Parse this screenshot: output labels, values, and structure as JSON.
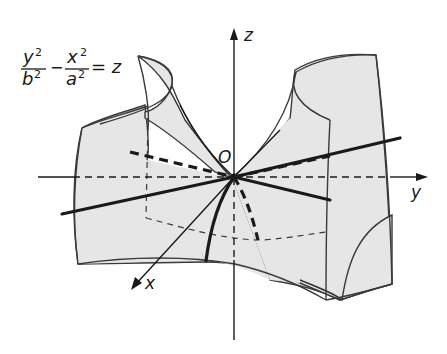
{
  "figure": {
    "equation": {
      "y_num": "y",
      "y_den": "b",
      "x_num": "x",
      "x_den": "a",
      "exp": "2",
      "minus": "−",
      "equals": "= z"
    },
    "axes": {
      "x_label": "x",
      "y_label": "y",
      "z_label": "z",
      "origin_label": "O"
    },
    "colors": {
      "surface_fill": "#e6e6e6",
      "stroke": "#1a1a1a",
      "background": "#ffffff"
    }
  }
}
